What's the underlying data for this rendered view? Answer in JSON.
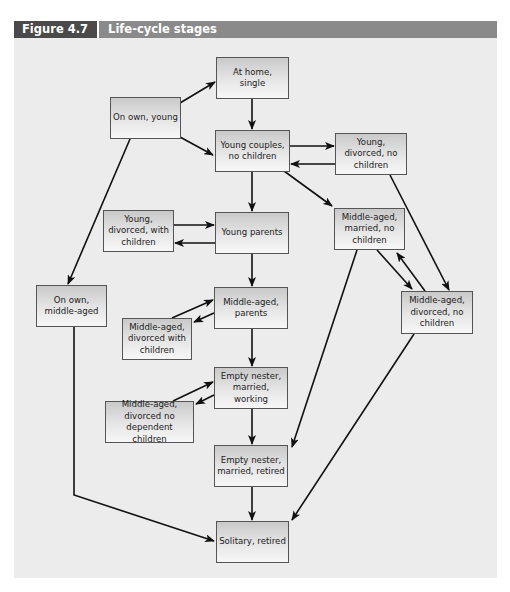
{
  "figure": {
    "number": "Figure 4.7",
    "title": "Life-cycle stages"
  },
  "colors": {
    "header_bar": "#8a8a8a",
    "figure_number_bg": "#4a4a4a",
    "panel_bg": "#ececec",
    "node_border": "#555555",
    "arrow": "#111111"
  },
  "nodes": {
    "at_home_single": "At home,\nsingle",
    "on_own_young": "On own, young",
    "young_couples_no_children": "Young couples,\nno children",
    "young_divorced_no_children": "Young,\ndivorced, no\nchildren",
    "young_divorced_with_children": "Young,\ndivorced, with\nchildren",
    "young_parents": "Young parents",
    "middle_aged_married_no_children": "Middle-aged,\nmarried, no\nchildren",
    "on_own_middle_aged": "On own,\nmiddle-aged",
    "middle_aged_parents": "Middle-aged,\nparents",
    "middle_aged_divorced_with_children": "Middle-aged,\ndivorced with\nchildren",
    "middle_aged_divorced_no_children": "Middle-aged,\ndivorced, no\nchildren",
    "empty_nester_married_working": "Empty nester,\nmarried, working",
    "middle_aged_divorced_no_dependent_children": "Middle-aged,\ndivorced no\ndependent children",
    "empty_nester_married_retired": "Empty nester,\nmarried, retired",
    "solitary_retired": "Solitary, retired"
  },
  "edges": [
    {
      "from": "On own, young",
      "to": "At home, single"
    },
    {
      "from": "On own, young",
      "to": "Young couples, no children"
    },
    {
      "from": "On own, young",
      "to": "On own, middle-aged"
    },
    {
      "from": "At home, single",
      "to": "Young couples, no children"
    },
    {
      "from": "Young couples, no children",
      "to": "Young, divorced, no children"
    },
    {
      "from": "Young, divorced, no children",
      "to": "Young couples, no children"
    },
    {
      "from": "Young couples, no children",
      "to": "Young parents"
    },
    {
      "from": "Young couples, no children",
      "to": "Middle-aged, married, no children"
    },
    {
      "from": "Young, divorced, no children",
      "to": "Middle-aged, divorced, no children"
    },
    {
      "from": "Young, divorced, with children",
      "to": "Young parents"
    },
    {
      "from": "Young parents",
      "to": "Young, divorced, with children"
    },
    {
      "from": "Young parents",
      "to": "Middle-aged, parents"
    },
    {
      "from": "Middle-aged, married, no children",
      "to": "Middle-aged, divorced, no children"
    },
    {
      "from": "Middle-aged, divorced, no children",
      "to": "Middle-aged, married, no children"
    },
    {
      "from": "Middle-aged, married, no children",
      "to": "Empty nester, married, retired"
    },
    {
      "from": "Middle-aged, divorced with children",
      "to": "Middle-aged, parents"
    },
    {
      "from": "Middle-aged, parents",
      "to": "Middle-aged, divorced with children"
    },
    {
      "from": "Middle-aged, parents",
      "to": "Empty nester, married, working"
    },
    {
      "from": "Middle-aged, divorced no dependent children",
      "to": "Empty nester, married, working"
    },
    {
      "from": "Empty nester, married, working",
      "to": "Middle-aged, divorced no dependent children"
    },
    {
      "from": "Empty nester, married, working",
      "to": "Empty nester, married, retired"
    },
    {
      "from": "Empty nester, married, retired",
      "to": "Solitary, retired"
    },
    {
      "from": "On own, middle-aged",
      "to": "Solitary, retired"
    },
    {
      "from": "Middle-aged, divorced, no children",
      "to": "Solitary, retired"
    }
  ]
}
